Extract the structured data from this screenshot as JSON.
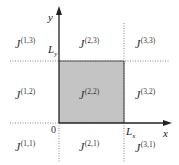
{
  "diagram": {
    "axes": {
      "x_label": "x",
      "y_label": "y",
      "origin_label": "0",
      "Lx": {
        "base": "L",
        "sub": "x"
      },
      "Ly": {
        "base": "L",
        "sub": "y"
      }
    },
    "colors": {
      "shaded_region": "#c4c4c4",
      "axis": "#222222",
      "dotted": "#888888",
      "text": "#333333"
    },
    "regions": [
      {
        "id": "1-3",
        "base": "J",
        "sup": "(1,3)"
      },
      {
        "id": "2-3",
        "base": "J",
        "sup": "(2,3)"
      },
      {
        "id": "3-3",
        "base": "J",
        "sup": "(3,3)"
      },
      {
        "id": "1-2",
        "base": "J",
        "sup": "(1,2)"
      },
      {
        "id": "2-2",
        "base": "J",
        "sup": "(2,2)"
      },
      {
        "id": "3-2",
        "base": "J",
        "sup": "(3,2)"
      },
      {
        "id": "1-1",
        "base": "J",
        "sup": "(1,1)"
      },
      {
        "id": "2-1",
        "base": "J",
        "sup": "(2,1)"
      },
      {
        "id": "3-1",
        "base": "J",
        "sup": "(3,1)"
      }
    ]
  }
}
